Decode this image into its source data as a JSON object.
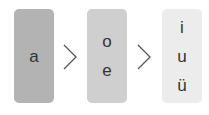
{
  "diagram": {
    "groups": [
      {
        "letters": [
          "a"
        ],
        "color": "#b3b3b3"
      },
      {
        "letters": [
          "o",
          "e"
        ],
        "color": "#cfcfcf"
      },
      {
        "letters": [
          "i",
          "u",
          "ü"
        ],
        "color": "#ececec"
      }
    ],
    "separator": ">",
    "separator_icon": "chevron-right-icon"
  }
}
